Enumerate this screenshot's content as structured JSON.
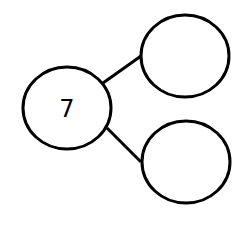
{
  "diagram": {
    "type": "number-bond",
    "whole": {
      "label": "7",
      "cx": 67,
      "cy": 108,
      "rx": 45,
      "ry": 42
    },
    "parts": [
      {
        "label": "",
        "cx": 185,
        "cy": 56,
        "rx": 44,
        "ry": 42
      },
      {
        "label": "",
        "cx": 186,
        "cy": 162,
        "rx": 44,
        "ry": 42
      }
    ],
    "connectors": [
      {
        "from": "whole",
        "to": "part-top",
        "x1": 103,
        "y1": 83,
        "x2": 141,
        "y2": 56
      },
      {
        "from": "whole",
        "to": "part-bottom",
        "x1": 107,
        "y1": 128,
        "x2": 141,
        "y2": 162
      }
    ],
    "colors": {
      "stroke": "#000000",
      "background": "#ffffff"
    }
  }
}
